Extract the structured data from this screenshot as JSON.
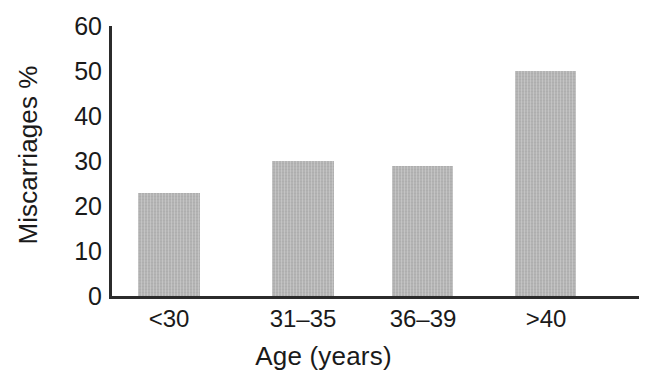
{
  "chart_data": {
    "type": "bar",
    "title": "",
    "subtitle": "",
    "categories": [
      "<30",
      "31–35",
      "36–39",
      ">40"
    ],
    "values": [
      23,
      30,
      29,
      50
    ],
    "series": [
      {
        "name": "Miscarriages %",
        "values": [
          23,
          30,
          29,
          50
        ]
      }
    ],
    "xlabel": "Age (years)",
    "ylabel": "Miscarriages %",
    "ylim": [
      0,
      60
    ],
    "yticks": [
      0,
      10,
      20,
      30,
      40,
      50,
      60
    ],
    "ytick_labels": [
      "0",
      "10",
      "20",
      "30",
      "40",
      "50",
      "60"
    ],
    "grid": false,
    "legend": false,
    "legend_position": "none",
    "bar_color": "#b4b4b4",
    "axis_color": "#2b2b2b",
    "text_color": "#1a1a1a",
    "background_color": "#ffffff",
    "annotations": []
  }
}
